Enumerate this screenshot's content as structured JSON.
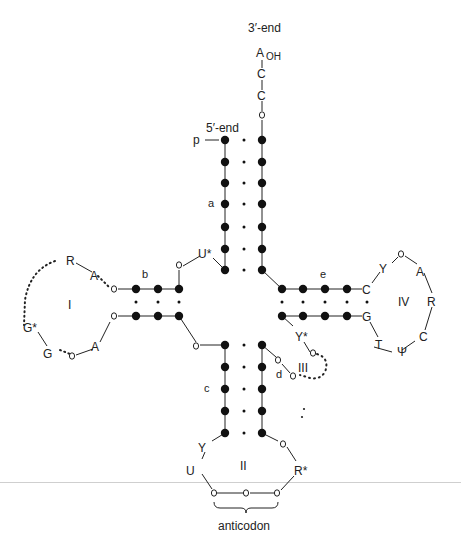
{
  "diagram": {
    "ends": {
      "three_prime_label": "3′-end",
      "five_prime_label": "5′-end",
      "terminal_A": "A",
      "terminal_OH": "OH",
      "c1": "C",
      "c2": "C",
      "phosphate": "p"
    },
    "stem_labels": {
      "a": "a",
      "b": "b",
      "c": "c",
      "d": "d",
      "e": "e"
    },
    "loop_labels": {
      "I": "I",
      "II": "II",
      "III": "III",
      "IV": "IV"
    },
    "loop_I": {
      "R": "R",
      "A1": "A",
      "G_star": "G*",
      "G": "G",
      "A2": "A"
    },
    "junction": {
      "U_star": "U*"
    },
    "loop_IV": {
      "C": "C",
      "Y": "Y",
      "A": "A",
      "R": "R",
      "C2": "C",
      "Psi": "Ψ",
      "T": "T",
      "G": "G"
    },
    "loop_III": {
      "Y_star": "Y*"
    },
    "loop_II": {
      "Y": "Y",
      "U": "U",
      "R_star": "R*"
    },
    "anticodon_label": "anticodon",
    "legend": {
      "filled_circle": "paired nucleotide",
      "open_circle": "unpaired nucleotide",
      "dotted_line": "variable length region"
    },
    "colors": {
      "ink": "#111111",
      "background": "#ffffff"
    }
  }
}
